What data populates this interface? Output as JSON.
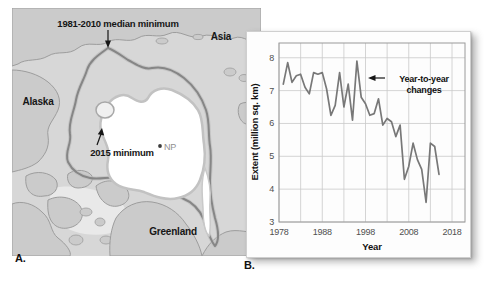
{
  "figure": {
    "panel_a_label": "A.",
    "panel_b_label": "B."
  },
  "map": {
    "labels": {
      "median_annotation": "1981-2010 median minimum",
      "min2015_annotation": "2015 minimum",
      "alaska": "Alaska",
      "asia": "Asia",
      "greenland": "Greenland",
      "north_pole": "NP"
    },
    "colors": {
      "ocean": "#d7d7d7",
      "land": "#cbcbcb",
      "coastline": "#9d9d9d",
      "median_edge": "#868686",
      "ice_2015": "#ffffff",
      "channel_ice": "#e9e9e9"
    }
  },
  "chart_data": {
    "type": "line",
    "title": "",
    "xlabel": "Year",
    "ylabel": "Extent (million sq. km)",
    "annotation": [
      "Year-to-year",
      "changes"
    ],
    "series_name": "Arctic sea ice minimum extent",
    "x": [
      1979,
      1980,
      1981,
      1982,
      1983,
      1984,
      1985,
      1986,
      1987,
      1988,
      1989,
      1990,
      1991,
      1992,
      1993,
      1994,
      1995,
      1996,
      1997,
      1998,
      1999,
      2000,
      2001,
      2002,
      2003,
      2004,
      2005,
      2006,
      2007,
      2008,
      2009,
      2010,
      2011,
      2012,
      2013,
      2014,
      2015
    ],
    "values": [
      7.2,
      7.85,
      7.25,
      7.45,
      7.5,
      7.1,
      6.9,
      7.55,
      7.5,
      7.55,
      7.05,
      6.25,
      6.55,
      7.55,
      6.5,
      7.2,
      6.1,
      7.9,
      6.8,
      6.6,
      6.25,
      6.3,
      6.75,
      5.95,
      6.15,
      6.05,
      5.6,
      5.95,
      4.3,
      4.7,
      5.4,
      4.9,
      4.6,
      3.6,
      5.4,
      5.3,
      4.45
    ],
    "xlim": [
      1978,
      2021
    ],
    "ylim": [
      3,
      8.45
    ],
    "xticks": [
      1978,
      1988,
      1998,
      2008,
      2018
    ],
    "x_grid_step": 5,
    "yticks": [
      3,
      4,
      5,
      6,
      7,
      8
    ],
    "grid": true,
    "line_color": "#787878",
    "grid_color": "#c9c9c9",
    "frame_color": "#9a9a9a"
  }
}
